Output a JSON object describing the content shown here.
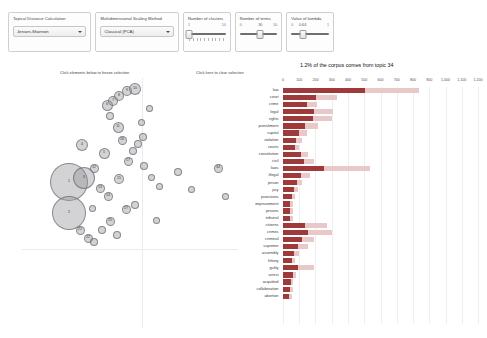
{
  "controls": {
    "distance": {
      "label": "Topical Distance Calculation",
      "value": "Jensen-Shannon",
      "options": [
        "Jensen-Shannon",
        "Euclidean",
        "Jaccard",
        "Hellinger"
      ]
    },
    "scaling": {
      "label": "Multidimensional Scaling Method",
      "value": "Classical (PCA)",
      "options": [
        "Classical (PCA)",
        "Kruskal",
        "Sammon"
      ]
    },
    "clusters": {
      "label": "Number of clusters",
      "value": "1",
      "min": "1",
      "max": "10"
    },
    "terms": {
      "label": "Number of terms",
      "value": "30",
      "min": "0",
      "max": "50"
    },
    "lambda": {
      "label": "Value of lambda",
      "value": "0.64",
      "min": "0",
      "max": "1"
    }
  },
  "hints": {
    "freeze": "Click elements below to freeze selection",
    "clear": "Click here to clear selection"
  },
  "bar_title": "1.2% of the corpus comes from topic 34",
  "chart_data": {
    "type": "bar",
    "title": "1.2% of the corpus comes from topic 34",
    "xlabel": "",
    "ylabel": "",
    "orientation": "horizontal",
    "xlim": [
      0,
      1200
    ],
    "grid": true,
    "legend": [
      "Overall term frequency",
      "Estimated term frequency within the selected topic"
    ],
    "ticks": [
      "0",
      "100",
      "200",
      "300",
      "400",
      "500",
      "600",
      "700",
      "800",
      "900",
      "1,000",
      "1,100",
      "1,200"
    ],
    "categories": [
      "law",
      "court",
      "crime",
      "legal",
      "rights",
      "punishment",
      "capital",
      "violation",
      "courts",
      "constitution",
      "civil",
      "laws",
      "illegal",
      "prison",
      "jury",
      "provisions",
      "imprisonment",
      "prisons",
      "tribunal",
      "citizens",
      "crimes",
      "criminal",
      "supreme",
      "assembly",
      "felony",
      "guilty",
      "arrest",
      "acquitted",
      "collaboration",
      "abortion"
    ],
    "series": [
      {
        "name": "Overall term frequency",
        "values": [
          830,
          330,
          208,
          305,
          300,
          214,
          145,
          118,
          98,
          152,
          188,
          530,
          165,
          118,
          92,
          72,
          58,
          60,
          62,
          270,
          300,
          186,
          150,
          96,
          76,
          190,
          78,
          62,
          60,
          52
        ]
      },
      {
        "name": "Estimated term frequency within the selected topic",
        "values": [
          500,
          200,
          145,
          190,
          182,
          135,
          98,
          82,
          72,
          108,
          126,
          250,
          112,
          84,
          66,
          52,
          42,
          44,
          45,
          132,
          152,
          116,
          92,
          70,
          56,
          90,
          58,
          46,
          44,
          38
        ]
      }
    ]
  },
  "scatter": {
    "bubbles": [
      {
        "id": "1",
        "x": 47,
        "y": 104,
        "r": 19
      },
      {
        "id": "2",
        "x": 47,
        "y": 135,
        "r": 17
      },
      {
        "id": "3",
        "x": 62,
        "y": 100,
        "r": 11
      },
      {
        "id": "4",
        "x": 60,
        "y": 67,
        "r": 6
      },
      {
        "id": "5",
        "x": 82,
        "y": 75,
        "r": 5.5
      },
      {
        "id": "6",
        "x": 85,
        "y": 27,
        "r": 5.5
      },
      {
        "id": "7",
        "x": 91,
        "y": 23,
        "r": 5
      },
      {
        "id": "8",
        "x": 97,
        "y": 18,
        "r": 5
      },
      {
        "id": "9",
        "x": 105,
        "y": 13,
        "r": 5
      },
      {
        "id": "10",
        "x": 113,
        "y": 11,
        "r": 6
      },
      {
        "id": "11",
        "x": 96,
        "y": 49,
        "r": 5.5
      },
      {
        "id": "12",
        "x": 72,
        "y": 90,
        "r": 4.5
      },
      {
        "id": "13",
        "x": 78,
        "y": 110,
        "r": 4.5
      },
      {
        "id": "14",
        "x": 86,
        "y": 118,
        "r": 4.5
      },
      {
        "id": "15",
        "x": 97,
        "y": 101,
        "r": 5
      },
      {
        "id": "16",
        "x": 100,
        "y": 62,
        "r": 4.5
      },
      {
        "id": "17",
        "x": 106,
        "y": 83,
        "r": 4.5
      },
      {
        "id": "18",
        "x": 111,
        "y": 73,
        "r": 4
      },
      {
        "id": "19",
        "x": 116,
        "y": 66,
        "r": 4
      },
      {
        "id": "20",
        "x": 121,
        "y": 59,
        "r": 4
      },
      {
        "id": "21",
        "x": 58,
        "y": 152,
        "r": 4.5
      },
      {
        "id": "22",
        "x": 66,
        "y": 160,
        "r": 4.5
      },
      {
        "id": "23",
        "x": 72,
        "y": 164,
        "r": 4
      },
      {
        "id": "24",
        "x": 80,
        "y": 152,
        "r": 4
      },
      {
        "id": "25",
        "x": 88,
        "y": 143,
        "r": 4.5
      },
      {
        "id": "26",
        "x": 95,
        "y": 157,
        "r": 4
      },
      {
        "id": "27",
        "x": 104,
        "y": 131,
        "r": 4.5
      },
      {
        "id": "28",
        "x": 113,
        "y": 127,
        "r": 4
      },
      {
        "id": "29",
        "x": 122,
        "y": 88,
        "r": 4
      },
      {
        "id": "30",
        "x": 129,
        "y": 99,
        "r": 3.5
      },
      {
        "id": "31",
        "x": 137,
        "y": 108,
        "r": 3.5
      },
      {
        "id": "32",
        "x": 156,
        "y": 94,
        "r": 4
      },
      {
        "id": "33",
        "x": 169,
        "y": 111,
        "r": 3.5
      },
      {
        "id": "34",
        "x": 196,
        "y": 90,
        "r": 4.5
      },
      {
        "id": "35",
        "x": 203,
        "y": 118,
        "r": 3.5
      },
      {
        "id": "36",
        "x": 88,
        "y": 38,
        "r": 4
      },
      {
        "id": "37",
        "x": 70,
        "y": 130,
        "r": 3.5
      },
      {
        "id": "38",
        "x": 119,
        "y": 44,
        "r": 3.5
      },
      {
        "id": "39",
        "x": 127,
        "y": 30,
        "r": 3.5
      },
      {
        "id": "40",
        "x": 134,
        "y": 142,
        "r": 3.5
      }
    ]
  }
}
